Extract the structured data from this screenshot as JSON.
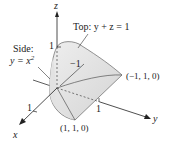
{
  "diagram": {
    "axes": {
      "x_label": "x",
      "y_label": "y",
      "z_label": "z",
      "x_tick": "1",
      "y_tick": "1",
      "z_tick": "1",
      "neg_tick": "−1"
    },
    "annotations": {
      "top_label": "Top:  y + z = 1",
      "side_label_line1": "Side:",
      "side_label_line2": "y = x",
      "side_label_sup": "2"
    },
    "points": {
      "p1": "(−1, 1, 0)",
      "p2": "(1, 1, 0)"
    },
    "colors": {
      "surface": "#d9d9d9",
      "surface_light": "#ebebeb",
      "line": "#333333",
      "background": "#ffffff"
    }
  }
}
